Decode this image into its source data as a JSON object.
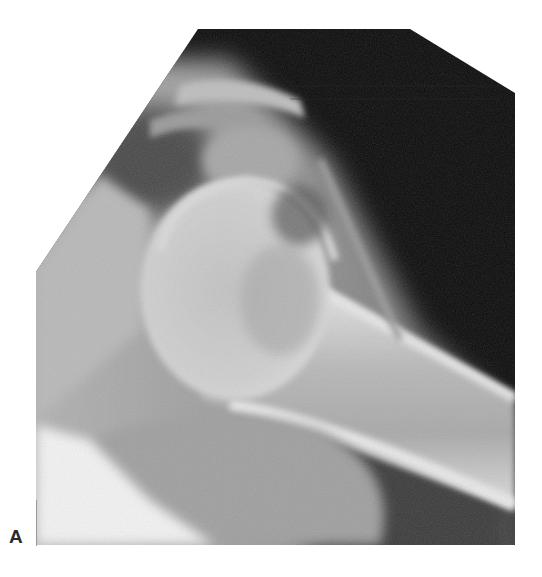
{
  "figure": {
    "panel_label": "A",
    "view_description": "Oblique radiograph of the shoulder showing humeral head, proximal humeral shaft, glenoid and acromion",
    "colors": {
      "background": "#ffffff",
      "film_dark": "#0a0a0a",
      "soft_tissue": "#8c8c8c",
      "bone_light": "#d6d6d6",
      "label": "#2a2a2a"
    }
  }
}
